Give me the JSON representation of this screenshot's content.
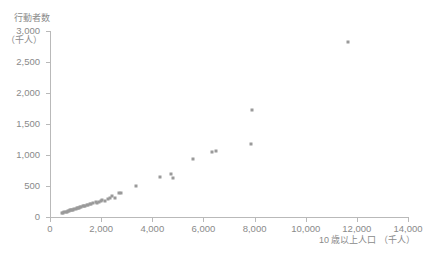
{
  "chart_data": {
    "type": "scatter",
    "title": "",
    "ylabel": "行動者数",
    "ylabel_unit": "（千人）",
    "xlabel": "10 歳以上人口 （千人）",
    "xlim": [
      0,
      14000
    ],
    "ylim": [
      0,
      3000
    ],
    "xticks": [
      0,
      2000,
      4000,
      6000,
      8000,
      10000,
      12000,
      14000
    ],
    "yticks": [
      0,
      500,
      1000,
      1500,
      2000,
      2500,
      3000
    ],
    "xticklabels": [
      "0",
      "2,000",
      "4,000",
      "6,000",
      "8,000",
      "10,000",
      "12,000",
      "14,000"
    ],
    "yticklabels": [
      "0",
      "500",
      "1,000",
      "1,500",
      "2,000",
      "2,500",
      "3,000"
    ],
    "grid": false,
    "legend": null,
    "marker_color": "#9a9a9a",
    "axis_color": "#b9b9b9",
    "points": [
      {
        "x": 480,
        "y": 60
      },
      {
        "x": 520,
        "y": 70
      },
      {
        "x": 560,
        "y": 75
      },
      {
        "x": 620,
        "y": 85
      },
      {
        "x": 660,
        "y": 80
      },
      {
        "x": 700,
        "y": 95
      },
      {
        "x": 740,
        "y": 100
      },
      {
        "x": 780,
        "y": 105
      },
      {
        "x": 820,
        "y": 110
      },
      {
        "x": 860,
        "y": 120
      },
      {
        "x": 900,
        "y": 115
      },
      {
        "x": 950,
        "y": 130
      },
      {
        "x": 1000,
        "y": 135
      },
      {
        "x": 1050,
        "y": 140
      },
      {
        "x": 1080,
        "y": 150
      },
      {
        "x": 1120,
        "y": 145
      },
      {
        "x": 1180,
        "y": 160
      },
      {
        "x": 1220,
        "y": 155
      },
      {
        "x": 1280,
        "y": 175
      },
      {
        "x": 1320,
        "y": 170
      },
      {
        "x": 1380,
        "y": 185
      },
      {
        "x": 1450,
        "y": 190
      },
      {
        "x": 1500,
        "y": 200
      },
      {
        "x": 1560,
        "y": 205
      },
      {
        "x": 1620,
        "y": 215
      },
      {
        "x": 1700,
        "y": 225
      },
      {
        "x": 1780,
        "y": 240
      },
      {
        "x": 1850,
        "y": 230
      },
      {
        "x": 1900,
        "y": 250
      },
      {
        "x": 1980,
        "y": 260
      },
      {
        "x": 2050,
        "y": 270
      },
      {
        "x": 2150,
        "y": 255
      },
      {
        "x": 2250,
        "y": 290
      },
      {
        "x": 2350,
        "y": 300
      },
      {
        "x": 2420,
        "y": 345
      },
      {
        "x": 2550,
        "y": 310
      },
      {
        "x": 2700,
        "y": 390
      },
      {
        "x": 2780,
        "y": 395
      },
      {
        "x": 3350,
        "y": 500
      },
      {
        "x": 4300,
        "y": 640
      },
      {
        "x": 4750,
        "y": 700
      },
      {
        "x": 4820,
        "y": 630
      },
      {
        "x": 5600,
        "y": 930
      },
      {
        "x": 6350,
        "y": 1050
      },
      {
        "x": 6500,
        "y": 1060
      },
      {
        "x": 7850,
        "y": 1180
      },
      {
        "x": 7900,
        "y": 1720
      },
      {
        "x": 11650,
        "y": 2830
      }
    ]
  }
}
